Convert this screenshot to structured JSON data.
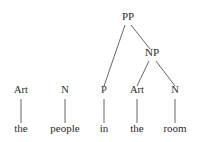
{
  "figure": {
    "kind": "constituency-syntax-tree",
    "sentence": "the people in the room",
    "width": 200,
    "height": 142,
    "background_color": "#ffffff",
    "text_color": "#2b2b2b",
    "line_color": "#555555"
  },
  "nodes": {
    "pp": {
      "label": "PP",
      "x": 128,
      "y": 22
    },
    "np": {
      "label": "NP",
      "x": 152,
      "y": 58
    },
    "pos": [
      {
        "label": "Art",
        "x": 21,
        "y": 95
      },
      {
        "label": "N",
        "x": 65,
        "y": 95
      },
      {
        "label": "P",
        "x": 104,
        "y": 95
      },
      {
        "label": "Art",
        "x": 137,
        "y": 95
      },
      {
        "label": "N",
        "x": 175,
        "y": 95
      }
    ],
    "words": [
      {
        "label": "the",
        "x": 21,
        "y": 134
      },
      {
        "label": "people",
        "x": 65,
        "y": 134
      },
      {
        "label": "in",
        "x": 104,
        "y": 134
      },
      {
        "label": "the",
        "x": 137,
        "y": 134
      },
      {
        "label": "room",
        "x": 175,
        "y": 134
      }
    ]
  },
  "edges": [
    {
      "name": "pp-to-p",
      "x1": 125,
      "y1": 25,
      "x2": 104,
      "y2": 86
    },
    {
      "name": "pp-to-np",
      "x1": 131,
      "y1": 25,
      "x2": 150,
      "y2": 49
    },
    {
      "name": "np-to-art",
      "x1": 149,
      "y1": 61,
      "x2": 137,
      "y2": 86
    },
    {
      "name": "np-to-n",
      "x1": 156,
      "y1": 61,
      "x2": 175,
      "y2": 86
    },
    {
      "name": "art1-to-the",
      "x1": 21,
      "y1": 99,
      "x2": 21,
      "y2": 123
    },
    {
      "name": "n1-to-people",
      "x1": 65,
      "y1": 99,
      "x2": 65,
      "y2": 123
    },
    {
      "name": "p-to-in",
      "x1": 104,
      "y1": 99,
      "x2": 104,
      "y2": 123
    },
    {
      "name": "art2-to-the",
      "x1": 137,
      "y1": 99,
      "x2": 137,
      "y2": 123
    },
    {
      "name": "n2-to-room",
      "x1": 175,
      "y1": 99,
      "x2": 175,
      "y2": 123
    }
  ]
}
